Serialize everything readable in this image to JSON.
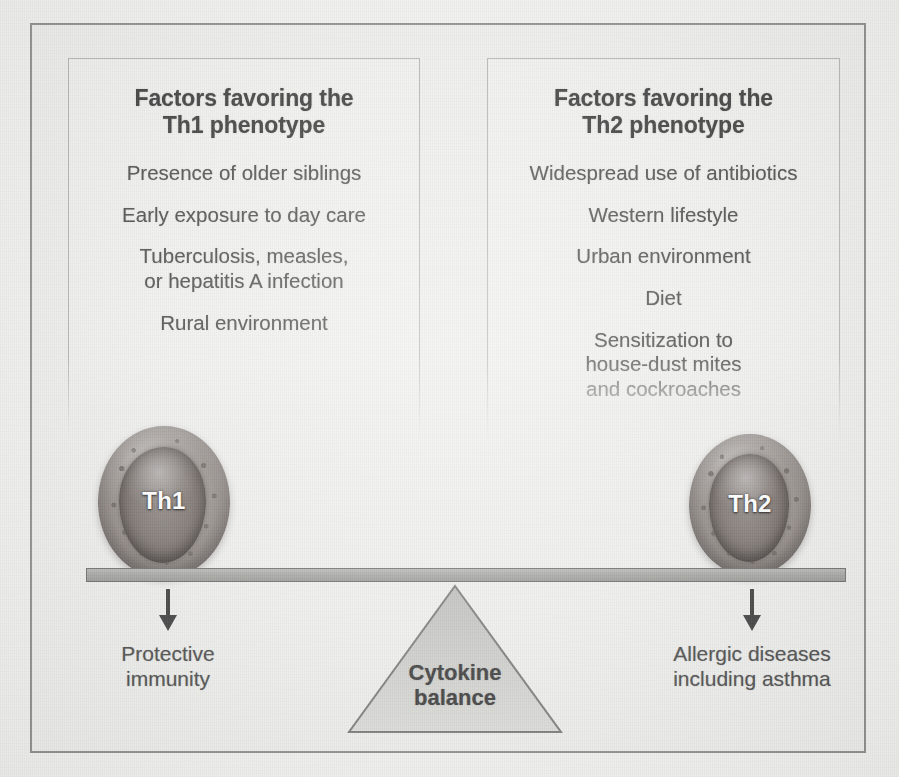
{
  "figure": {
    "background_color": "#eeeeec",
    "frame_color": "#8f8f8d",
    "panel_border_color": "#b4b4b2",
    "text_color": "#4e4e4e",
    "heading_color": "#3c3c3c"
  },
  "panels": [
    {
      "id": "th1",
      "heading": "Factors favoring the\nTh1 phenotype",
      "items": [
        "Presence of older siblings",
        "Early exposure to day care",
        "Tuberculosis, measles,\nor hepatitis A infection",
        "Rural environment"
      ]
    },
    {
      "id": "th2",
      "heading": "Factors favoring the\nTh2 phenotype",
      "items": [
        "Widespread use of antibiotics",
        "Western lifestyle",
        "Urban environment",
        "Diet",
        "Sensitization to\nhouse-dust mites\nand cockroaches"
      ]
    }
  ],
  "cells": [
    {
      "id": "th1",
      "label": "Th1",
      "icon": "lymphocyte-cell-icon"
    },
    {
      "id": "th2",
      "label": "Th2",
      "icon": "lymphocyte-cell-icon"
    }
  ],
  "fulcrum": {
    "label": "Cytokine\nbalance",
    "icon": "triangle-fulcrum-icon"
  },
  "beam": {
    "icon": "balance-beam-icon",
    "fill_color": "#a7a7a4",
    "border_color": "#6f6f6c"
  },
  "outcomes": [
    {
      "id": "left",
      "arrow_icon": "arrow-down-icon",
      "label": "Protective\nimmunity"
    },
    {
      "id": "right",
      "arrow_icon": "arrow-down-icon",
      "label": "Allergic diseases\nincluding asthma"
    }
  ]
}
